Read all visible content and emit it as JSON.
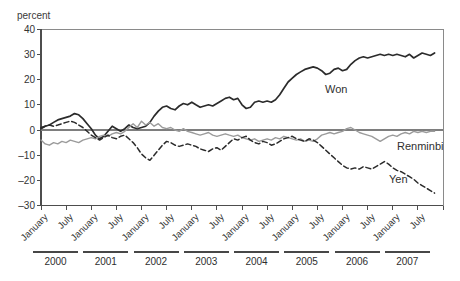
{
  "chart_data": {
    "type": "line",
    "y_unit_label": "percent",
    "ylim": [
      -30,
      40
    ],
    "yticks": [
      40,
      30,
      20,
      10,
      0,
      -10,
      -20,
      -30
    ],
    "ytick_labels": [
      "40",
      "30",
      "20",
      "10",
      "0",
      "–10",
      "–20",
      "–30"
    ],
    "zero_line": true,
    "x_start": "2000-01",
    "x_frequency": "monthly",
    "years": [
      "2000",
      "2001",
      "2002",
      "2003",
      "2004",
      "2005",
      "2006",
      "2007"
    ],
    "month_tick_labels": [
      "January",
      "July"
    ],
    "axis_color": "#4d4d4d",
    "border_color": "#8a8a8a",
    "zero_line_color": "#7e7e7e",
    "series": [
      {
        "name": "Won",
        "style": "solid",
        "color": "#2b2b2b",
        "stroke_width": 1.7,
        "values": [
          0.5,
          1.5,
          2.0,
          3.0,
          4.0,
          4.5,
          5.0,
          5.5,
          6.5,
          6.0,
          4.5,
          2.5,
          0.5,
          -2.0,
          -3.5,
          -2.5,
          -0.5,
          1.5,
          0.5,
          -0.5,
          0.5,
          2.0,
          1.0,
          0.5,
          1.0,
          1.5,
          3.0,
          5.5,
          7.5,
          9.0,
          9.5,
          8.5,
          8.0,
          9.5,
          10.5,
          10.0,
          11.0,
          10.0,
          9.0,
          9.5,
          10.0,
          9.5,
          10.5,
          11.5,
          12.5,
          13.0,
          12.0,
          12.5,
          10.0,
          8.5,
          9.0,
          11.0,
          11.5,
          11.0,
          11.5,
          11.0,
          12.0,
          14.0,
          16.5,
          19.0,
          20.5,
          22.0,
          23.0,
          24.0,
          24.5,
          25.0,
          24.5,
          23.5,
          22.0,
          22.5,
          24.0,
          24.5,
          23.5,
          24.0,
          26.0,
          27.5,
          28.5,
          29.0,
          28.5,
          29.0,
          29.5,
          30.0,
          29.5,
          30.0,
          29.5,
          30.0,
          29.5,
          29.0,
          30.0,
          28.5,
          29.5,
          30.5,
          30.0,
          29.5,
          30.5
        ]
      },
      {
        "name": "Renminbi",
        "style": "solid",
        "color": "#9b9b9b",
        "stroke_width": 1.4,
        "values": [
          -4.0,
          -5.5,
          -6.0,
          -5.0,
          -5.5,
          -4.5,
          -5.0,
          -4.0,
          -4.5,
          -5.0,
          -4.0,
          -3.5,
          -3.0,
          -3.5,
          -2.5,
          -2.0,
          -2.5,
          -1.5,
          -1.0,
          -1.5,
          -0.5,
          1.0,
          2.5,
          1.0,
          3.5,
          2.0,
          3.0,
          1.5,
          2.5,
          1.0,
          0.5,
          1.0,
          0.0,
          -0.5,
          0.5,
          -0.5,
          -1.0,
          -1.5,
          -2.0,
          -1.5,
          -1.0,
          -2.0,
          -2.5,
          -2.0,
          -1.5,
          -2.0,
          -2.5,
          -2.0,
          -3.0,
          -3.5,
          -4.0,
          -3.5,
          -4.5,
          -4.0,
          -3.5,
          -4.0,
          -3.0,
          -3.5,
          -2.5,
          -3.0,
          -3.5,
          -4.0,
          -3.5,
          -4.5,
          -4.0,
          -4.5,
          -3.5,
          -2.0,
          -1.5,
          -1.0,
          -1.5,
          -1.0,
          -0.5,
          0.5,
          1.0,
          0.0,
          -1.0,
          -1.5,
          -2.0,
          -2.5,
          -3.5,
          -4.5,
          -3.5,
          -2.5,
          -2.0,
          -2.5,
          -1.5,
          -1.0,
          -1.5,
          -0.5,
          -1.0,
          -0.5,
          -1.0,
          -0.5,
          -0.5
        ]
      },
      {
        "name": "Yen",
        "style": "dashed",
        "color": "#2b2b2b",
        "stroke_width": 1.5,
        "values": [
          1.0,
          1.5,
          2.0,
          1.5,
          2.0,
          2.5,
          3.0,
          3.5,
          3.0,
          2.0,
          1.0,
          -0.5,
          -2.0,
          -3.0,
          -4.0,
          -3.0,
          -2.0,
          -3.0,
          -3.5,
          -2.5,
          -2.0,
          -3.5,
          -5.0,
          -7.0,
          -9.5,
          -11.0,
          -12.0,
          -10.0,
          -8.0,
          -6.0,
          -4.5,
          -5.0,
          -6.0,
          -6.5,
          -6.0,
          -5.5,
          -6.0,
          -6.5,
          -7.5,
          -8.0,
          -8.5,
          -7.5,
          -7.0,
          -8.0,
          -6.5,
          -5.0,
          -3.5,
          -4.0,
          -3.0,
          -2.5,
          -4.0,
          -5.0,
          -5.5,
          -4.5,
          -5.0,
          -6.0,
          -5.5,
          -4.5,
          -3.5,
          -3.0,
          -2.5,
          -3.5,
          -4.0,
          -4.5,
          -3.5,
          -4.0,
          -5.0,
          -6.5,
          -8.0,
          -9.5,
          -11.0,
          -12.5,
          -14.0,
          -15.0,
          -15.5,
          -15.0,
          -15.5,
          -14.5,
          -15.0,
          -15.5,
          -14.5,
          -13.5,
          -12.5,
          -13.5,
          -15.0,
          -16.0,
          -16.5,
          -17.5,
          -18.5,
          -19.5,
          -21.0,
          -22.0,
          -23.0,
          -24.0,
          -25.0
        ]
      }
    ]
  }
}
